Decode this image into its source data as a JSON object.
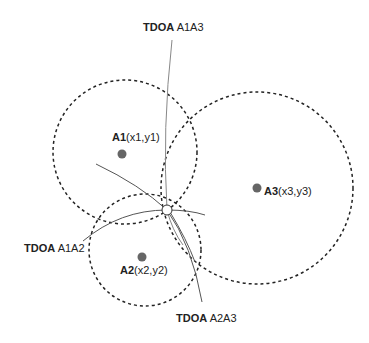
{
  "anchors": [
    {
      "id": "A1",
      "name": "A1",
      "coords": "(x1,y1)",
      "cx": 122,
      "cy": 154,
      "r": 72,
      "ccx": 125,
      "ccy": 152
    },
    {
      "id": "A2",
      "name": "A2",
      "coords": "(x2,y2)",
      "cx": 142,
      "cy": 257,
      "r": 56,
      "ccx": 145,
      "ccy": 250
    },
    {
      "id": "A3",
      "name": "A3",
      "coords": "(x3,y3)",
      "cx": 257,
      "cy": 188,
      "r": 96,
      "ccx": 257,
      "ccy": 188
    }
  ],
  "tdoa_labels": [
    {
      "prefix": "TDOA",
      "pair": "A1A3"
    },
    {
      "prefix": "TDOA",
      "pair": "A1A2"
    },
    {
      "prefix": "TDOA",
      "pair": "A2A3"
    }
  ],
  "target_point": {
    "x": 167,
    "y": 210
  },
  "colors": {
    "anchor_dot": "#666666",
    "circle": "#222222",
    "hyperbola": "#777777"
  }
}
